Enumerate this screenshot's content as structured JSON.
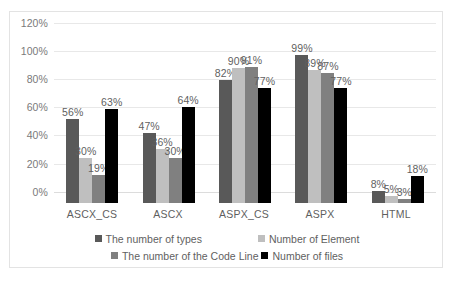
{
  "chart_data": {
    "type": "bar",
    "title": "",
    "xlabel": "",
    "ylabel": "",
    "ylim": [
      0,
      120
    ],
    "grid": true,
    "legend_position": "bottom",
    "categories": [
      "ASCX_CS",
      "ASCX",
      "ASPX_CS",
      "ASPX",
      "HTML"
    ],
    "y_ticks": [
      "0%",
      "20%",
      "40%",
      "60%",
      "80%",
      "100%",
      "120%"
    ],
    "y_tick_values": [
      0,
      20,
      40,
      60,
      80,
      100,
      120
    ],
    "series": [
      {
        "name": "The number of types",
        "color": "#595959",
        "values": [
          56,
          47,
          82,
          99,
          8
        ],
        "labels": [
          "56%",
          "47%",
          "82%",
          "99%",
          "8%"
        ]
      },
      {
        "name": "Number of Element",
        "color": "#bfbfbf",
        "values": [
          30,
          36,
          90,
          89,
          5
        ],
        "labels": [
          "30%",
          "36%",
          "90%",
          "89%",
          "5%"
        ]
      },
      {
        "name": "The number of the Code Line",
        "color": "#808080",
        "values": [
          19,
          30,
          91,
          87,
          3
        ],
        "labels": [
          "19%",
          "30%",
          "91%",
          "87%",
          "3%"
        ]
      },
      {
        "name": "Number of files",
        "color": "#000000",
        "values": [
          63,
          64,
          77,
          77,
          18
        ],
        "labels": [
          "63%",
          "64%",
          "77%",
          "77%",
          "18%"
        ]
      }
    ]
  }
}
